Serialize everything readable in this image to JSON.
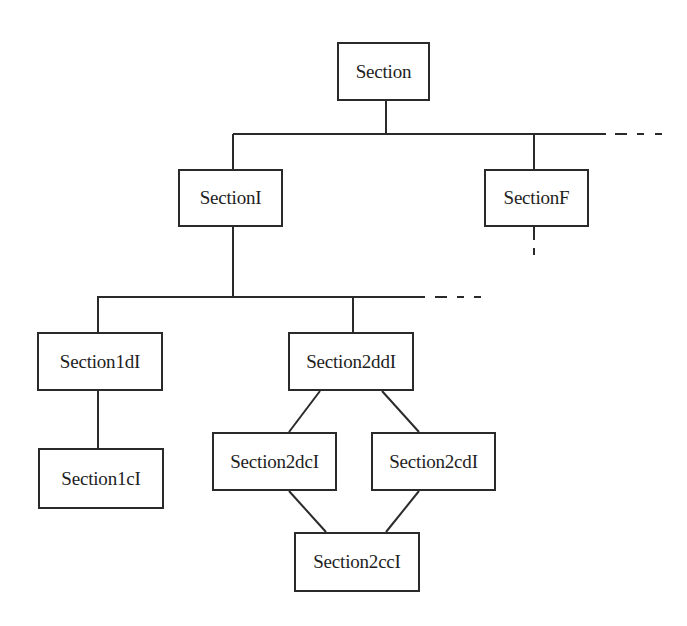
{
  "diagram": {
    "type": "hierarchy",
    "colors": {
      "line": "#2a2a2a",
      "text": "#1e1e1e",
      "background": "#ffffff"
    },
    "nodes": [
      {
        "id": "section",
        "label": "Section",
        "x": 337,
        "y": 42,
        "w": 93,
        "h": 59
      },
      {
        "id": "sectionI",
        "label": "SectionI",
        "x": 178,
        "y": 169,
        "w": 105,
        "h": 58
      },
      {
        "id": "sectionF",
        "label": "SectionF",
        "x": 484,
        "y": 169,
        "w": 105,
        "h": 58
      },
      {
        "id": "section1dI",
        "label": "Section1dI",
        "x": 37,
        "y": 332,
        "w": 126,
        "h": 59
      },
      {
        "id": "section2ddI",
        "label": "Section2ddI",
        "x": 288,
        "y": 332,
        "w": 126,
        "h": 59
      },
      {
        "id": "section1cI",
        "label": "Section1cI",
        "x": 38,
        "y": 448,
        "w": 126,
        "h": 61
      },
      {
        "id": "section2dcI",
        "label": "Section2dcI",
        "x": 212,
        "y": 432,
        "w": 125,
        "h": 59
      },
      {
        "id": "section2cdI",
        "label": "Section2cdI",
        "x": 371,
        "y": 432,
        "w": 125,
        "h": 59
      },
      {
        "id": "section2ccI",
        "label": "Section2ccI",
        "x": 294,
        "y": 532,
        "w": 126,
        "h": 60
      }
    ],
    "edges": [
      {
        "from": "section",
        "to": "sectionI"
      },
      {
        "from": "section",
        "to": "sectionF"
      },
      {
        "from": "section",
        "to": "more (elided)",
        "style": "dashed"
      },
      {
        "from": "sectionF",
        "to": "more (elided)",
        "style": "dashed"
      },
      {
        "from": "sectionI",
        "to": "section1dI"
      },
      {
        "from": "sectionI",
        "to": "section2ddI"
      },
      {
        "from": "sectionI",
        "to": "more (elided)",
        "style": "dashed"
      },
      {
        "from": "section1dI",
        "to": "section1cI"
      },
      {
        "from": "section2ddI",
        "to": "section2dcI"
      },
      {
        "from": "section2ddI",
        "to": "section2cdI"
      },
      {
        "from": "section2dcI",
        "to": "section2ccI"
      },
      {
        "from": "section2cdI",
        "to": "section2ccI"
      }
    ]
  }
}
